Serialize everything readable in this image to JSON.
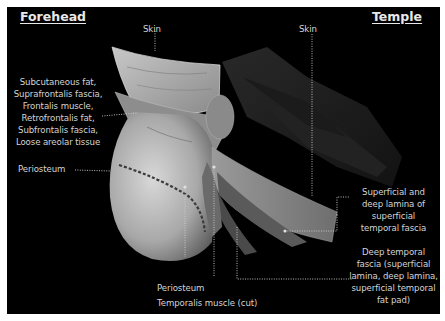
{
  "headings": {
    "left": "Forehead",
    "right": "Temple"
  },
  "labels": {
    "skin_left": "Skin",
    "skin_right": "Skin",
    "forehead_layers": [
      "Subcutaneous fat,",
      "Suprafrontalis fascia,",
      "Frontalis muscle,",
      "Retrofrontalis fat,",
      "Subfrontalis fascia,",
      "Loose areolar tissue"
    ],
    "periosteum_left": "Periosteum",
    "periosteum_bottom": "Periosteum",
    "temporalis": "Temporalis muscle (cut)",
    "superficial_temporal_fascia": [
      "Superficial and",
      "deep lamina of",
      "superficial",
      "temporal fascia"
    ],
    "deep_temporal_fascia": [
      "Deep temporal",
      "fascia (superficial",
      "lamina, deep lamina,",
      "superficial temporal",
      "fat pad)"
    ]
  },
  "colors": {
    "background": "#000000",
    "border": "#ffffff",
    "text": "#d4d4d4",
    "leader_line": "#cfcfcf"
  }
}
